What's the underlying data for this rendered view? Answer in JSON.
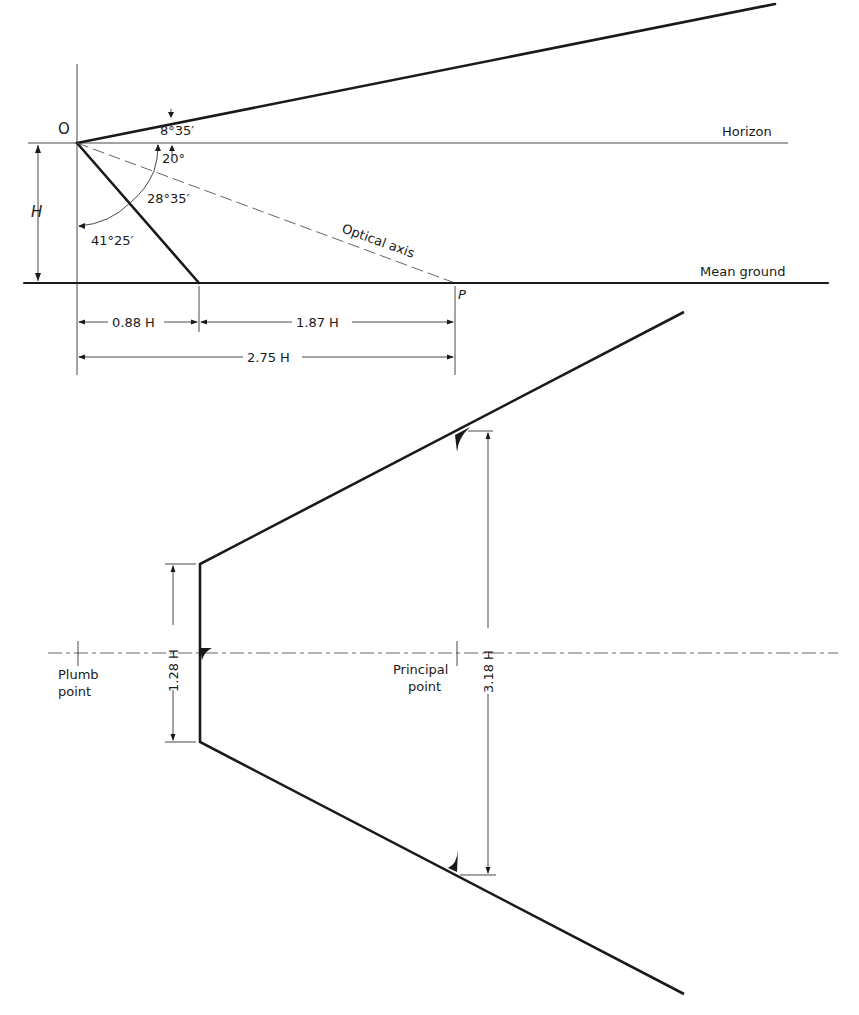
{
  "figure": {
    "type": "oblique-photo-geometry",
    "side_view": {
      "point_o": "O",
      "horizon_label": "Horizon",
      "mean_ground_label": "Mean ground",
      "optical_axis_label": "Optical axis",
      "principal_ground_point": "P",
      "height_label": "H",
      "angles": {
        "upper_ray_above_horizon": "8°35′",
        "axis_depression": "20°",
        "half_field_angle": "28°35′",
        "lower_ray_from_vertical": "41°25′"
      },
      "dimensions": {
        "near_distance": "0.88 H",
        "axis_to_near_distance": "1.87 H",
        "total_distance": "2.75 H"
      }
    },
    "plan_view": {
      "plumb_point_label_line1": "Plumb",
      "plumb_point_label_line2": "point",
      "principal_point_label_line1": "Principal",
      "principal_point_label_line2": "point",
      "near_edge_width": "1.28 H",
      "far_width_at_principal": "3.18 H"
    }
  }
}
